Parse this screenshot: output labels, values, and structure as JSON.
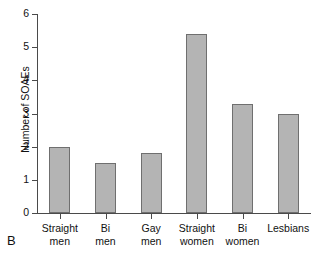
{
  "panel": {
    "label": "B"
  },
  "chart_data": {
    "type": "bar",
    "title": "",
    "xlabel": "",
    "ylabel": "Number of SOAEs",
    "categories": [
      "Straight men",
      "Bi men",
      "Gay men",
      "Straight women",
      "Bi women",
      "Lesbians"
    ],
    "category_lines": [
      [
        "Straight",
        "men"
      ],
      [
        "Bi",
        "men"
      ],
      [
        "Gay",
        "men"
      ],
      [
        "Straight",
        "women"
      ],
      [
        "Bi",
        "women"
      ],
      [
        "Lesbians",
        ""
      ]
    ],
    "values": [
      2.0,
      1.5,
      1.8,
      5.4,
      3.3,
      3.0
    ],
    "ylim": [
      0,
      6
    ],
    "ytick_values": [
      0,
      1,
      2,
      3,
      4,
      5,
      6
    ],
    "ytick_labels": [
      "0",
      "1",
      "2",
      "3",
      "4",
      "5",
      "6"
    ],
    "grid": false,
    "legend": null,
    "bar_color": "#b4b4b4",
    "bar_edge_color": "#6f6f6f",
    "axis_color": "#4a4a4a"
  }
}
